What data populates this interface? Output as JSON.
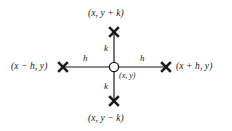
{
  "figure": {
    "name": "five-point-stencil",
    "background_color": "#ffffff",
    "stroke_color": "#1a1a1a",
    "text_color": "#1a1a1a"
  },
  "nodes": {
    "center": {
      "label": "(x, y)",
      "marker": "open-circle",
      "x": 114,
      "y": 67
    },
    "top": {
      "label": "(x, y + k)",
      "marker": "x-cross",
      "x": 114,
      "y": 32
    },
    "bottom": {
      "label": "(x, y − k)",
      "marker": "x-cross",
      "x": 114,
      "y": 101
    },
    "left": {
      "label": "(x − h, y)",
      "marker": "x-cross",
      "x": 63,
      "y": 67
    },
    "right": {
      "label": "(x + h, y)",
      "marker": "x-cross",
      "x": 166,
      "y": 67
    }
  },
  "edges": {
    "left_h": "h",
    "right_h": "h",
    "top_k": "k",
    "bottom_k": "k"
  }
}
